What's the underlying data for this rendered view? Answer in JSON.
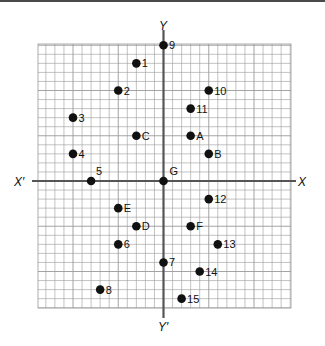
{
  "chart_data": {
    "type": "scatter",
    "title": "",
    "axes": {
      "x_positive_label": "X",
      "x_negative_label": "X′",
      "y_positive_label": "Y",
      "y_negative_label": "Y′"
    },
    "grid": true,
    "grid_range": {
      "x": [
        -14,
        14
      ],
      "y": [
        -14,
        15
      ]
    },
    "origin_label": "G",
    "points": [
      {
        "label": "9",
        "x": 0,
        "y": 15
      },
      {
        "label": "1",
        "x": -3,
        "y": 13
      },
      {
        "label": "2",
        "x": -5,
        "y": 10
      },
      {
        "label": "10",
        "x": 5,
        "y": 10
      },
      {
        "label": "11",
        "x": 3,
        "y": 8
      },
      {
        "label": "3",
        "x": -10,
        "y": 7
      },
      {
        "label": "C",
        "x": -3,
        "y": 5
      },
      {
        "label": "A",
        "x": 3,
        "y": 5
      },
      {
        "label": "4",
        "x": -10,
        "y": 3
      },
      {
        "label": "B",
        "x": 5,
        "y": 3
      },
      {
        "label": "5",
        "x": -8,
        "y": 0
      },
      {
        "label": "G",
        "x": 0,
        "y": 0
      },
      {
        "label": "12",
        "x": 5,
        "y": -2
      },
      {
        "label": "E",
        "x": -5,
        "y": -3
      },
      {
        "label": "D",
        "x": -3,
        "y": -5
      },
      {
        "label": "F",
        "x": 3,
        "y": -5
      },
      {
        "label": "6",
        "x": -5,
        "y": -7
      },
      {
        "label": "13",
        "x": 6,
        "y": -7
      },
      {
        "label": "7",
        "x": 0,
        "y": -9
      },
      {
        "label": "14",
        "x": 4,
        "y": -10
      },
      {
        "label": "8",
        "x": -7,
        "y": -12
      },
      {
        "label": "15",
        "x": 2,
        "y": -13
      }
    ]
  },
  "colors": {
    "grid": "#9a9a9a",
    "axis": "#555555",
    "point": "#111111"
  }
}
